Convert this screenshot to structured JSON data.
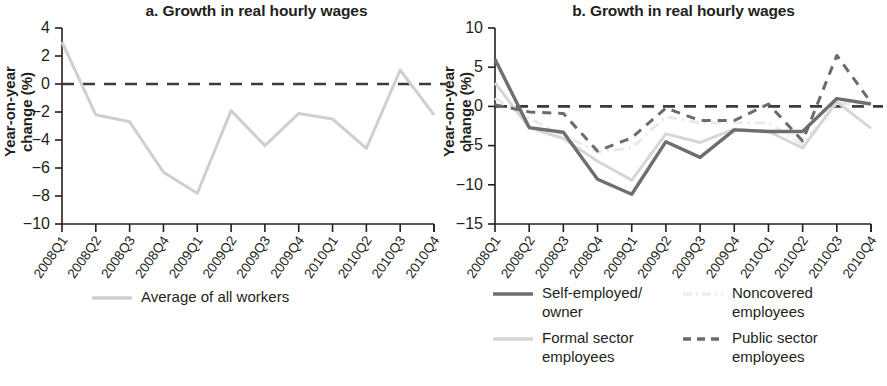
{
  "figure": {
    "panels": [
      {
        "id": "panel-a",
        "title": "a. Growth in real hourly wages",
        "ylabel": "Year-on-year\nchange (%)"
      },
      {
        "id": "panel-b",
        "title": "b. Growth in real hourly wages",
        "ylabel": "Year-on-year\nchange (%)"
      }
    ]
  },
  "chart_data": [
    {
      "type": "line",
      "panel": "a",
      "title": "a. Growth in real hourly wages",
      "xlabel": "",
      "ylabel": "Year-on-year change (%)",
      "ylim": [
        -10,
        4
      ],
      "yticks": [
        4,
        2,
        0,
        -2,
        -4,
        -6,
        -8,
        -10
      ],
      "ytick_labels": [
        "4",
        "2",
        "0",
        "−2",
        "−4",
        "−6",
        "−8",
        "−10"
      ],
      "grid": false,
      "legend_position": "bottom",
      "zero_reference_line": 0,
      "categories": [
        "2008Q1",
        "2008Q2",
        "2008Q3",
        "2008Q4",
        "2009Q1",
        "2009Q2",
        "2009Q3",
        "2009Q4",
        "2010Q1",
        "2010Q2",
        "2010Q3",
        "2010Q4"
      ],
      "series": [
        {
          "name": "Average of all workers",
          "color": "#cfcfcf",
          "style": "solid",
          "values": [
            3.0,
            -2.2,
            -2.7,
            -6.3,
            -7.8,
            -1.9,
            -4.4,
            -2.1,
            -2.5,
            -4.6,
            1.0,
            -2.2
          ]
        }
      ]
    },
    {
      "type": "line",
      "panel": "b",
      "title": "b. Growth in real hourly wages",
      "xlabel": "",
      "ylabel": "Year-on-year change (%)",
      "ylim": [
        -15,
        10
      ],
      "yticks": [
        10,
        5,
        0,
        -5,
        -10,
        -15
      ],
      "ytick_labels": [
        "10",
        "5",
        "0",
        "−5",
        "−10",
        "−15"
      ],
      "grid": false,
      "legend_position": "bottom",
      "zero_reference_line": 0,
      "categories": [
        "2008Q1",
        "2008Q2",
        "2008Q3",
        "2008Q4",
        "2009Q1",
        "2009Q2",
        "2009Q3",
        "2009Q4",
        "2010Q1",
        "2010Q2",
        "2010Q3",
        "2010Q4"
      ],
      "series": [
        {
          "name": "Self-employed/\nowner",
          "color": "#6e6e6e",
          "style": "solid",
          "values": [
            6.0,
            -2.7,
            -3.3,
            -9.3,
            -11.2,
            -4.5,
            -6.5,
            -3.0,
            -3.2,
            -3.2,
            1.0,
            0.3
          ]
        },
        {
          "name": "Formal sector\nemployees",
          "color": "#d6d6d6",
          "style": "solid",
          "values": [
            3.0,
            -2.7,
            -4.1,
            -7.0,
            -9.4,
            -3.5,
            -4.6,
            -2.9,
            -3.2,
            -5.3,
            0.6,
            -2.8
          ]
        },
        {
          "name": "Noncovered\nemployees",
          "color": "#e9e9e9",
          "style": "dashdot",
          "values": [
            1.0,
            -1.5,
            -3.7,
            -5.8,
            -5.3,
            -1.3,
            -2.1,
            -2.1,
            -2.1,
            -4.8,
            0.4,
            0.3
          ]
        },
        {
          "name": "Public sector\nemployees",
          "color": "#6b6b6b",
          "style": "dashed",
          "values": [
            0.2,
            -0.7,
            -0.9,
            -5.7,
            -4.0,
            -0.2,
            -1.8,
            -1.8,
            0.3,
            -4.4,
            6.5,
            0.5
          ]
        }
      ]
    }
  ],
  "legends": {
    "panel_a": [
      {
        "label": "Average of all workers",
        "color": "#cfcfcf",
        "style": "solid"
      }
    ],
    "panel_b": [
      {
        "label": "Self-employed/\nowner",
        "color": "#6e6e6e",
        "style": "solid"
      },
      {
        "label": "Noncovered\nemployees",
        "color": "#eeeeee",
        "style": "dashdot"
      },
      {
        "label": "Formal sector\nemployees",
        "color": "#d6d6d6",
        "style": "solid"
      },
      {
        "label": "Public sector\nemployees",
        "color": "#6b6b6b",
        "style": "dashed"
      }
    ]
  }
}
